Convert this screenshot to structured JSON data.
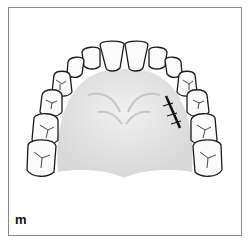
{
  "figure": {
    "panel_label": "m",
    "annotation": "suture on palatal mucosa",
    "colors": {
      "outline": "#1a1a1a",
      "palate": "#e2e2e2",
      "tooth": "#fbfbfb",
      "frame": "#8a8a8a"
    }
  }
}
